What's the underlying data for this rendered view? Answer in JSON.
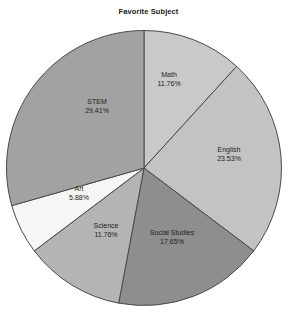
{
  "chart": {
    "title": "Favorite Subject",
    "background_color": "#ffffff",
    "stroke_color": "#4a4a4a"
  },
  "chart_data": {
    "type": "pie",
    "title": "Favorite Subject",
    "xlabel": "",
    "ylabel": "",
    "legend": "none",
    "grid": false,
    "start_angle_deg": 90,
    "direction": "clockwise",
    "categories": [
      "Math",
      "English",
      "Social Studies",
      "Science",
      "Art",
      "STEM"
    ],
    "values": [
      11.76,
      23.53,
      17.65,
      11.76,
      5.88,
      29.41
    ],
    "value_labels": [
      "11.76%",
      "23.53%",
      "17.65%",
      "11.76%",
      "5.88%",
      "29.41%"
    ],
    "colors": [
      "#c9c9c9",
      "#c3c3c3",
      "#8e8e8e",
      "#b4b4b4",
      "#f6f6f6",
      "#a2a2a2"
    ],
    "slices": [
      {
        "name": "Math",
        "value": 11.76,
        "percent_label": "11.76%",
        "color": "#c9c9c9",
        "label_x": 169,
        "label_y": 80
      },
      {
        "name": "English",
        "value": 23.53,
        "percent_label": "23.53%",
        "color": "#c3c3c3",
        "label_x": 229,
        "label_y": 155
      },
      {
        "name": "Social Studies",
        "value": 17.65,
        "percent_label": "17.65%",
        "color": "#8e8e8e",
        "label_x": 172,
        "label_y": 238
      },
      {
        "name": "Science",
        "value": 11.76,
        "percent_label": "11.76%",
        "color": "#b4b4b4",
        "label_x": 106,
        "label_y": 231
      },
      {
        "name": "Art",
        "value": 5.88,
        "percent_label": "5.88%",
        "color": "#f6f6f6",
        "label_x": 79,
        "label_y": 194
      },
      {
        "name": "STEM",
        "value": 29.41,
        "percent_label": "29.41%",
        "color": "#a2a2a2",
        "label_x": 97,
        "label_y": 107
      }
    ]
  }
}
